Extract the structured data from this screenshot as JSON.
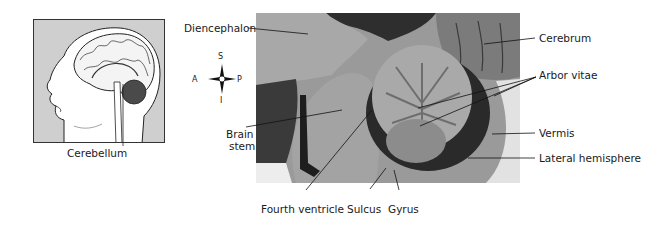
{
  "figure": {
    "inset": {
      "caption": "Cerebellum",
      "colors": {
        "background": "#cfcfcf",
        "cerebellum_highlight": "#4a4a4a"
      }
    },
    "compass": {
      "superior": "S",
      "inferior": "I",
      "anterior": "A",
      "posterior": "P"
    },
    "labels": {
      "diencephalon": "Diencephalon",
      "cerebrum": "Cerebrum",
      "arbor_vitae": "Arbor vitae",
      "brain_stem_line1": "Brain",
      "brain_stem_line2": "stem",
      "vermis": "Vermis",
      "lateral_hemisphere": "Lateral hemisphere",
      "fourth_ventricle": "Fourth ventricle",
      "sulcus": "Sulcus",
      "gyrus": "Gyrus"
    }
  }
}
